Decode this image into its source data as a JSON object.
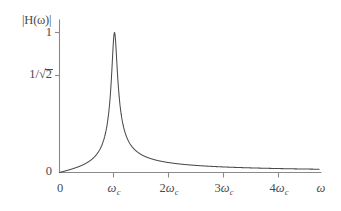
{
  "figure": {
    "background_color": "#ffffff",
    "axis_color": "#8a8a8a",
    "curve_color": "#4b4b4b",
    "y_axis_label": "|H(ω)|",
    "x_axis_label": "ω"
  },
  "labels": {
    "y_one": "1",
    "y_zero": "0",
    "y_half_power_numerator": "1/",
    "y_half_power_radical": "√",
    "y_half_power_radicand": "2",
    "x_zero": "0",
    "x_wc_base": "ω",
    "x_wc_sub": "c",
    "x_2wc_coef": "2",
    "x_3wc_coef": "3",
    "x_4wc_coef": "4",
    "omega_glyph": "ω"
  },
  "chart_data": {
    "type": "line",
    "title": "",
    "xlabel": "ω",
    "ylabel": "|H(ω)|",
    "xlim": [
      0,
      4.72
    ],
    "ylim": [
      0,
      1.06
    ],
    "grid": false,
    "legend": null,
    "x_tick_labels": [
      "0",
      "ω_c",
      "2ω_c",
      "3ω_c",
      "4ω_c"
    ],
    "x_tick_values": [
      0,
      1,
      2,
      3,
      4
    ],
    "y_tick_labels": [
      "0",
      "1/√2",
      "1"
    ],
    "y_tick_values": [
      0,
      0.7071,
      1
    ],
    "annotations": [
      "Resonant bandpass magnitude response peaking at ω = ω_c with |H| = 1",
      "Half-power level 1/√2 marked on the vertical axis"
    ],
    "curve_model": {
      "description": "Normalized second-order bandpass magnitude |H| = 1 / sqrt(1 + Q^2 (w/wc - wc/w)^2)",
      "Q": 9.5,
      "peak_x": 1.0,
      "peak_y": 1.0
    },
    "x": [
      0.0,
      0.1,
      0.2,
      0.3,
      0.4,
      0.5,
      0.6,
      0.7,
      0.8,
      0.85,
      0.9,
      0.94,
      0.97,
      1.0,
      1.03,
      1.06,
      1.1,
      1.15,
      1.2,
      1.3,
      1.4,
      1.5,
      1.6,
      1.8,
      2.0,
      2.2,
      2.5,
      3.0,
      3.5,
      4.0,
      4.5,
      4.72
    ],
    "values": [
      0.0,
      0.011,
      0.022,
      0.033,
      0.046,
      0.062,
      0.082,
      0.112,
      0.165,
      0.212,
      0.296,
      0.421,
      0.585,
      1.0,
      0.6,
      0.43,
      0.29,
      0.21,
      0.168,
      0.119,
      0.092,
      0.075,
      0.063,
      0.048,
      0.039,
      0.032,
      0.026,
      0.019,
      0.015,
      0.012,
      0.01,
      0.009
    ]
  }
}
